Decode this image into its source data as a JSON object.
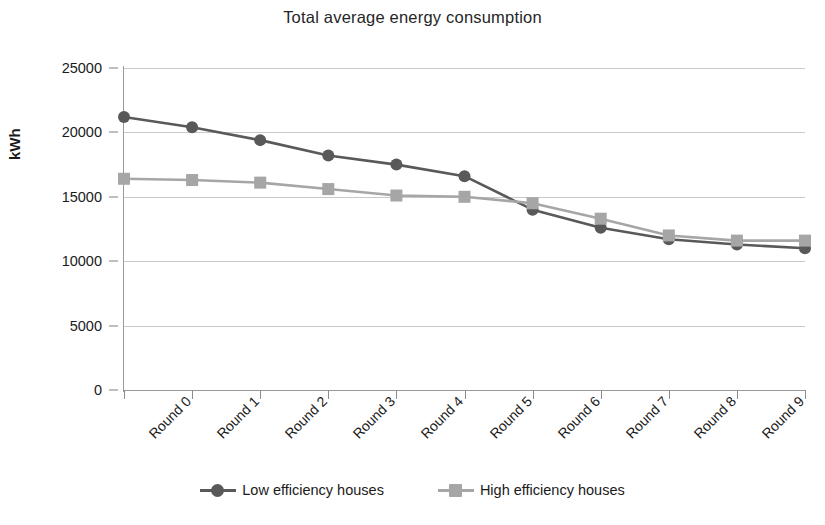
{
  "chart_data": {
    "type": "line",
    "title": "Total average energy consumption",
    "xlabel": "",
    "ylabel": "kWh",
    "categories": [
      "Round 0",
      "Round 1",
      "Round 2",
      "Round 3",
      "Round 4",
      "Round 5",
      "Round 6",
      "Round 7",
      "Round 8",
      "Round 9",
      "Round 10"
    ],
    "ylim": [
      0,
      25000
    ],
    "y_ticks": [
      0,
      5000,
      10000,
      15000,
      20000,
      25000
    ],
    "y_tick_labels": [
      "0",
      "5000",
      "10000",
      "15000",
      "20000",
      "25000"
    ],
    "grid": true,
    "legend_position": "bottom",
    "series": [
      {
        "name": "Low efficiency houses",
        "color": "#595959",
        "marker": "circle",
        "values": [
          21200,
          20400,
          19400,
          18200,
          17500,
          16600,
          14000,
          12600,
          11700,
          11300,
          11000
        ]
      },
      {
        "name": "High efficiency houses",
        "color": "#a6a6a6",
        "marker": "square",
        "values": [
          16400,
          16300,
          16100,
          15600,
          15100,
          15000,
          14500,
          13300,
          12000,
          11600,
          11600
        ]
      }
    ]
  },
  "legend": {
    "items": [
      {
        "label": "Low efficiency houses"
      },
      {
        "label": "High efficiency houses"
      }
    ]
  },
  "colors": {
    "low_efficiency": "#595959",
    "high_efficiency": "#a6a6a6",
    "axis": "#9a9a9a",
    "gridline": "#c9c9c9",
    "text": "#1a1a1a"
  }
}
